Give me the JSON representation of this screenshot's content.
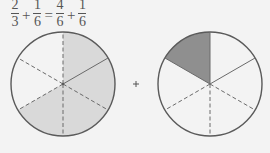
{
  "equation": {
    "terms": [
      {
        "num": "2",
        "den": "3"
      },
      {
        "op": "+"
      },
      {
        "num": "1",
        "den": "6"
      },
      {
        "op": "="
      },
      {
        "num": "4",
        "den": "6"
      },
      {
        "op": "+"
      },
      {
        "num": "1",
        "den": "6"
      }
    ]
  },
  "diagram": {
    "left_circle": {
      "fraction": "4/6",
      "shaded_sectors": 4,
      "total_sectors": 6,
      "fill": "#d9d9d9"
    },
    "operator": "+",
    "right_circle": {
      "fraction": "1/6",
      "shaded_sectors": 1,
      "total_sectors": 6,
      "fill": "#8f8f8f"
    },
    "stroke_color": "#5a5a5a"
  }
}
